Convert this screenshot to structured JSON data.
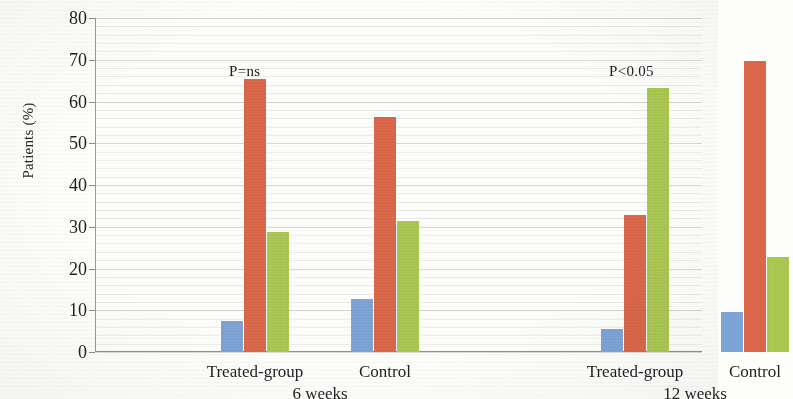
{
  "chart_data": {
    "type": "bar",
    "title": "",
    "xlabel": "",
    "ylabel": "Patients (%)",
    "ylim": [
      0,
      80
    ],
    "ytick_labels": [
      "0",
      "10",
      "20",
      "30",
      "40",
      "50",
      "60",
      "70",
      "80"
    ],
    "ytick_values": [
      0,
      10,
      20,
      30,
      40,
      50,
      60,
      70,
      80
    ],
    "grid": true,
    "legend": "none",
    "categories": [
      "Treated-group",
      "Control",
      "Treated-group",
      "Control"
    ],
    "group_labels": [
      "6 weeks",
      "12 weeks"
    ],
    "series": [
      {
        "name": "series-1",
        "color": "#7fa8dc",
        "values": [
          7.5,
          12.8,
          5.6,
          9.7
        ]
      },
      {
        "name": "series-2",
        "color": "#e2694a",
        "values": [
          65.3,
          56.3,
          32.7,
          69.6
        ]
      },
      {
        "name": "series-3",
        "color": "#aecd52",
        "values": [
          28.7,
          31.3,
          63.2,
          22.8
        ]
      }
    ],
    "annotations": [
      {
        "text": "P=ns",
        "group": "6 weeks"
      },
      {
        "text": "P<0.05",
        "group": "12 weeks"
      }
    ]
  },
  "colors": {
    "series_1": "#7fa8dc",
    "series_2": "#e2694a",
    "series_3": "#aecd52",
    "axis": "#8f8f8f",
    "grid": "#b9b9b9",
    "text": "#1f1f1f",
    "background": "#fdfdfb"
  }
}
